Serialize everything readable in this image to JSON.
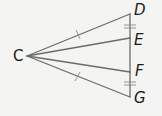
{
  "diagram": {
    "type": "geometry",
    "points": [
      {
        "id": "C",
        "label": "C"
      },
      {
        "id": "D",
        "label": "D"
      },
      {
        "id": "E",
        "label": "E"
      },
      {
        "id": "F",
        "label": "F"
      },
      {
        "id": "G",
        "label": "G"
      }
    ],
    "segments": [
      {
        "from": "C",
        "to": "D",
        "congruence_mark": "single"
      },
      {
        "from": "C",
        "to": "E",
        "congruence_mark": "none"
      },
      {
        "from": "C",
        "to": "F",
        "congruence_mark": "none"
      },
      {
        "from": "C",
        "to": "G",
        "congruence_mark": "single"
      },
      {
        "from": "D",
        "to": "E",
        "congruence_mark": "double"
      },
      {
        "from": "E",
        "to": "F",
        "congruence_mark": "none"
      },
      {
        "from": "F",
        "to": "G",
        "congruence_mark": "double"
      }
    ],
    "congruences": [
      [
        "CD",
        "CG"
      ],
      [
        "DE",
        "FG"
      ]
    ],
    "colors": {
      "line": "#6b6b6b",
      "label": "#1a1a1a",
      "background": "#f4f4f2"
    }
  }
}
